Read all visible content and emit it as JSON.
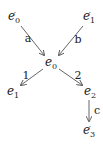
{
  "nodes": {
    "e0p": {
      "base": "e",
      "sub": "0",
      "prime": "′"
    },
    "e1p": {
      "base": "e",
      "sub": "1",
      "prime": "′"
    },
    "e0": {
      "base": "e",
      "sub": "0",
      "prime": ""
    },
    "e1": {
      "base": "e",
      "sub": "1",
      "prime": ""
    },
    "e2": {
      "base": "e",
      "sub": "2",
      "prime": ""
    },
    "e3p": {
      "base": "e",
      "sub": "3",
      "prime": "′"
    }
  },
  "edges": {
    "a": {
      "from": "e'0",
      "to": "e0",
      "label": "a"
    },
    "b": {
      "from": "e'1",
      "to": "e0",
      "label": "b"
    },
    "one": {
      "from": "e0",
      "to": "e1",
      "label": "1"
    },
    "two": {
      "from": "e0",
      "to": "e2",
      "label": "2"
    },
    "c": {
      "from": "e2",
      "to": "e'3",
      "label": "c"
    }
  },
  "colors": {
    "stroke": "#555555",
    "text": "#222222"
  }
}
